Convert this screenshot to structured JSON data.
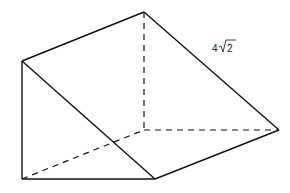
{
  "figure": {
    "type": "triangular prism",
    "edge_label": {
      "coefficient": "4",
      "radicand": "2",
      "text": "4√2"
    }
  }
}
